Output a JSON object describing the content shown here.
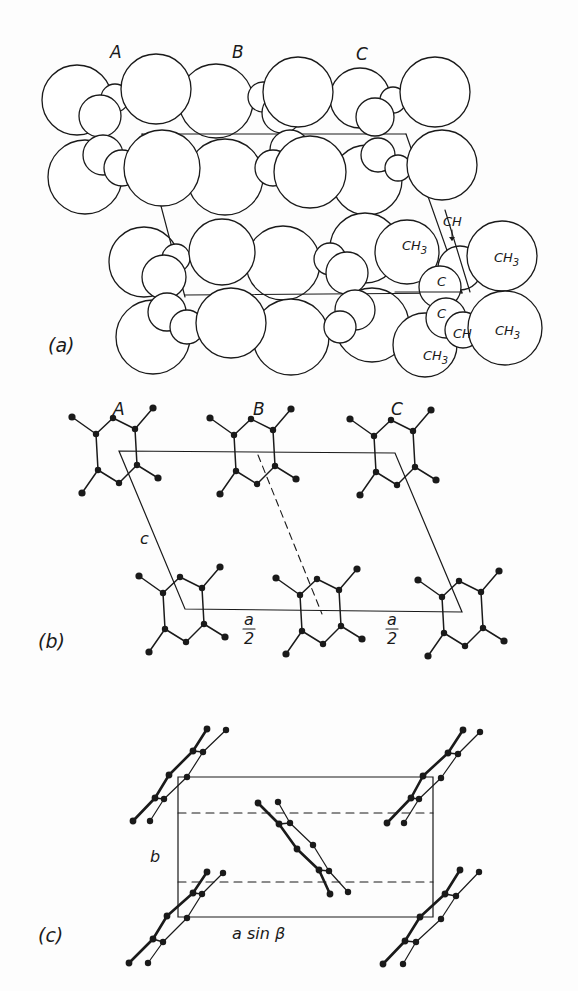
{
  "figure": {
    "stroke_color": "#1a1a1a",
    "background": "#fdfdfd",
    "panels": [
      {
        "id": "a",
        "label": "(a)",
        "label_pos": [
          48,
          352
        ],
        "description": "space-filling model",
        "molecule_labels": [
          {
            "text": "A",
            "x": 110,
            "y": 58
          },
          {
            "text": "B",
            "x": 232,
            "y": 58
          },
          {
            "text": "C",
            "x": 356,
            "y": 60
          }
        ],
        "cell_lines": [
          [
            [
              142,
              134
            ],
            [
              406,
              134
            ]
          ],
          [
            [
              142,
              134
            ],
            [
              185,
              297
            ]
          ],
          [
            [
              406,
              134
            ],
            [
              462,
              293
            ]
          ],
          [
            [
              185,
              295
            ],
            [
              462,
              293
            ]
          ]
        ],
        "circles_back": [
          [
            77,
            100,
            35
          ],
          [
            85,
            177,
            37
          ],
          [
            216,
            101,
            37
          ],
          [
            225,
            177,
            38
          ],
          [
            360,
            98,
            30
          ],
          [
            367,
            180,
            35
          ],
          [
            144,
            262,
            35
          ],
          [
            153,
            337,
            37
          ],
          [
            283,
            263,
            37
          ],
          [
            291,
            337,
            38
          ],
          [
            365,
            248,
            35
          ],
          [
            372,
            325,
            37
          ],
          [
            425,
            345,
            32
          ]
        ],
        "circles_small": [
          [
            115,
            98,
            14
          ],
          [
            100,
            116,
            21
          ],
          [
            103,
            155,
            20
          ],
          [
            122,
            168,
            18
          ],
          [
            263,
            97,
            15
          ],
          [
            282,
            113,
            20
          ],
          [
            290,
            150,
            20
          ],
          [
            273,
            168,
            18
          ],
          [
            393,
            100,
            13
          ],
          [
            375,
            117,
            19
          ],
          [
            378,
            155,
            17
          ],
          [
            398,
            168,
            13
          ],
          [
            176,
            258,
            14
          ],
          [
            164,
            277,
            22
          ],
          [
            167,
            312,
            19
          ],
          [
            187,
            327,
            17
          ],
          [
            330,
            259,
            16
          ],
          [
            347,
            273,
            21
          ],
          [
            355,
            310,
            20
          ],
          [
            340,
            327,
            16
          ]
        ],
        "circles_front": [
          [
            156,
            89,
            35
          ],
          [
            162,
            168,
            38
          ],
          [
            298,
            92,
            35
          ],
          [
            310,
            172,
            36
          ],
          [
            435,
            92,
            35
          ],
          [
            442,
            165,
            35
          ],
          [
            222,
            252,
            33
          ],
          [
            231,
            323,
            35
          ]
        ],
        "right_group": {
          "circles": [
            [
              407,
              252,
              32
            ],
            [
              460,
              268,
              22
            ],
            [
              440,
              287,
              21
            ],
            [
              446,
              318,
              20
            ],
            [
              463,
              330,
              18
            ],
            [
              502,
              256,
              35
            ],
            [
              505,
              328,
              37
            ]
          ],
          "labels": [
            {
              "text": "CH",
              "x": 443,
              "y": 226
            },
            {
              "text": "CH",
              "sub": "3",
              "x": 402,
              "y": 250
            },
            {
              "text": "CH",
              "sub": "3",
              "x": 494,
              "y": 262
            },
            {
              "text": "C",
              "x": 437,
              "y": 286
            },
            {
              "text": "C",
              "x": 437,
              "y": 318
            },
            {
              "text": "CH",
              "x": 453,
              "y": 338
            },
            {
              "text": "CH",
              "sub": "3",
              "x": 495,
              "y": 335
            },
            {
              "text": "CH",
              "sub": "3",
              "x": 423,
              "y": 360
            }
          ],
          "arrow": [
            [
              452,
              230
            ],
            [
              452,
              240
            ]
          ]
        }
      },
      {
        "id": "b",
        "label": "(b)",
        "label_pos": [
          38,
          648
        ],
        "description": "projection along b axis",
        "molecule_labels": [
          {
            "text": "A",
            "x": 113,
            "y": 415
          },
          {
            "text": "B",
            "x": 253,
            "y": 415
          },
          {
            "text": "C",
            "x": 391,
            "y": 415
          }
        ],
        "cell": [
          [
            119,
            451
          ],
          [
            395,
            453
          ],
          [
            462,
            612
          ],
          [
            185,
            609
          ]
        ],
        "dashed": [
          [
            258,
            455
          ],
          [
            322,
            614
          ]
        ],
        "axis_labels": [
          {
            "text": "c",
            "x": 140,
            "y": 544
          },
          {
            "text": "a",
            "denominator": "2",
            "x": 249,
            "y": 625
          },
          {
            "text": "a",
            "denominator": "2",
            "x": 392,
            "y": 625
          }
        ],
        "molecule_template": {
          "atoms": [
            [
              72,
              417
            ],
            [
              113,
              418
            ],
            [
              96,
              434
            ],
            [
              135,
              429
            ],
            [
              153,
              408
            ],
            [
              98,
              470
            ],
            [
              137,
              465
            ],
            [
              119,
              483
            ],
            [
              82,
              493
            ],
            [
              158,
              478
            ]
          ],
          "bonds": [
            [
              0,
              2
            ],
            [
              2,
              1
            ],
            [
              1,
              3
            ],
            [
              3,
              4
            ],
            [
              2,
              5
            ],
            [
              3,
              6
            ],
            [
              5,
              7
            ],
            [
              7,
              6
            ],
            [
              5,
              8
            ],
            [
              6,
              9
            ]
          ]
        },
        "molecule_offsets": [
          [
            0,
            0
          ],
          [
            138,
            1
          ],
          [
            278,
            2
          ],
          [
            67,
            159
          ],
          [
            204,
            161
          ],
          [
            346,
            163
          ]
        ]
      },
      {
        "id": "c",
        "label": "(c)",
        "label_pos": [
          38,
          942
        ],
        "description": "projection along c axis",
        "cell": [
          [
            178,
            777
          ],
          [
            433,
            777
          ],
          [
            433,
            917
          ],
          [
            178,
            917
          ]
        ],
        "dashed_lines": [
          [
            [
              178,
              813
            ],
            [
              433,
              813
            ]
          ],
          [
            [
              178,
              882
            ],
            [
              433,
              882
            ]
          ]
        ],
        "axis_labels": [
          {
            "text": "b",
            "x": 150,
            "y": 862
          },
          {
            "text": "a sin β",
            "x": 232,
            "y": 939
          }
        ],
        "molecules": [
          {
            "thick": [
              [
                207,
                729
              ],
              [
                193,
                751
              ],
              [
                169,
                775
              ],
              [
                155,
                798
              ],
              [
                133,
                821
              ]
            ],
            "thin": [
              [
                226,
                730
              ],
              [
                203,
                752
              ],
              [
                187,
                777
              ],
              [
                164,
                799
              ],
              [
                150,
                821
              ]
            ]
          },
          {
            "thick": [
              [
                463,
                730
              ],
              [
                448,
                753
              ],
              [
                423,
                776
              ],
              [
                411,
                798
              ],
              [
                387,
                823
              ]
            ],
            "thin": [
              [
                480,
                732
              ],
              [
                458,
                754
              ],
              [
                441,
                778
              ],
              [
                419,
                799
              ],
              [
                404,
                823
              ]
            ]
          },
          {
            "thick": [
              [
                258,
                803
              ],
              [
                279,
                824
              ],
              [
                297,
                849
              ],
              [
                319,
                870
              ],
              [
                330,
                894
              ]
            ],
            "thin": [
              [
                278,
                802
              ],
              [
                290,
                823
              ],
              [
                313,
                845
              ],
              [
                329,
                871
              ],
              [
                348,
                892
              ]
            ]
          },
          {
            "thick": [
              [
                207,
                872
              ],
              [
                193,
                893
              ],
              [
                167,
                916
              ],
              [
                153,
                939
              ],
              [
                129,
                963
              ]
            ],
            "thin": [
              [
                223,
                873
              ],
              [
                202,
                894
              ],
              [
                187,
                918
              ],
              [
                163,
                942
              ],
              [
                148,
                963
              ]
            ]
          },
          {
            "thick": [
              [
                460,
                870
              ],
              [
                445,
                894
              ],
              [
                420,
                917
              ],
              [
                405,
                941
              ],
              [
                383,
                964
              ]
            ],
            "thin": [
              [
                479,
                872
              ],
              [
                456,
                896
              ],
              [
                441,
                919
              ],
              [
                416,
                942
              ],
              [
                403,
                964
              ]
            ]
          }
        ]
      }
    ]
  }
}
